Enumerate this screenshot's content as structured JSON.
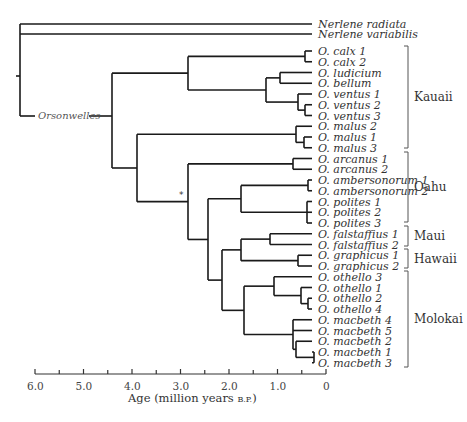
{
  "figure": {
    "genus_label": "Orsonwelles",
    "support_marker": "*",
    "outgroups": [
      {
        "label": "Nerlene radiata",
        "y": 24
      },
      {
        "label": "Nerlene variabilis",
        "y": 34
      }
    ],
    "leaves": [
      "O. calx 1",
      "O. calx 2",
      "O. ludicium",
      "O. bellum",
      "O. ventus 1",
      "O. ventus 2",
      "O. ventus 3",
      "O. malus 2",
      "O. malus 1",
      "O. malus 3",
      "O. arcanus 1",
      "O. arcanus 2",
      "O. ambersonorum 1",
      "O. ambersonorum 2",
      "O. polites 1",
      "O. polites 2",
      "O. polites 3",
      "O. falstaffius 1",
      "O. falstaffius 2",
      "O. graphicus 1",
      "O. graphicus 2",
      "O. othello 3",
      "O. othello 1",
      "O. othello 2",
      "O. othello 4",
      "O. macbeth 4",
      "O. macbeth 5",
      "O. macbeth 2",
      "O. macbeth 1",
      "O. macbeth 3"
    ],
    "islands": [
      {
        "label": "Kauaii",
        "top": 46,
        "bottom": 148
      },
      {
        "label": "Oahu",
        "top": 152,
        "bottom": 222
      },
      {
        "label": "Maui",
        "top": 226,
        "bottom": 246
      },
      {
        "label": "Hawaii",
        "top": 249,
        "bottom": 268
      },
      {
        "label": "Molokai",
        "top": 271,
        "bottom": 367
      }
    ],
    "axis": {
      "title": "Age (million years ",
      "title_suffix": "B.P.",
      "title_close": ")",
      "ticks": [
        "6.0",
        "5.0",
        "4.0",
        "3.0",
        "2.0",
        "1.0",
        "0"
      ],
      "tick_values": [
        6.0,
        5.0,
        4.0,
        3.0,
        2.0,
        1.0,
        0
      ],
      "range": [
        6.0,
        0
      ]
    }
  }
}
